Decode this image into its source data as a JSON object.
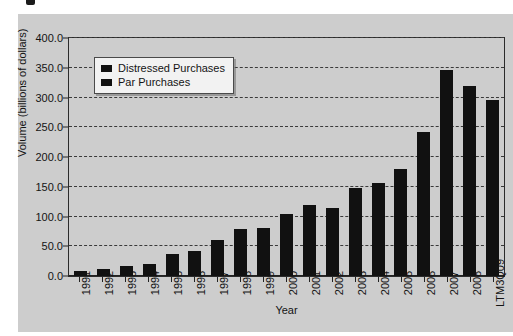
{
  "chart_data": {
    "type": "bar",
    "title": "",
    "xlabel": "Year",
    "ylabel": "Volume (billions of dollars)",
    "ylim": [
      0,
      400
    ],
    "ytick_step": 50,
    "grid": true,
    "legend_position": "top-left",
    "categories": [
      "1991",
      "1992",
      "1993",
      "1994",
      "1995",
      "1996",
      "1997",
      "1998",
      "1999",
      "2000",
      "2001",
      "2002",
      "2003",
      "2004",
      "2005",
      "2006",
      "2007",
      "2008",
      "LTM3Q09"
    ],
    "ytick_labels": [
      "400.0",
      "350.0",
      "300.0",
      "250.0",
      "200.0",
      "150.0",
      "100.0",
      "50.0",
      "0.0"
    ],
    "ytick_values": [
      400,
      350,
      300,
      250,
      200,
      150,
      100,
      50,
      0
    ],
    "series": [
      {
        "name": "Par Purchases",
        "color": "#111111",
        "values": [
          8,
          11,
          16,
          21,
          37,
          42,
          60,
          79,
          81,
          104,
          120,
          114,
          148,
          157,
          180,
          242,
          347,
          320,
          295
        ]
      }
    ],
    "legend": [
      {
        "label": "Distressed Purchases",
        "color": "#111111"
      },
      {
        "label": "Par Purchases",
        "color": "#111111"
      }
    ]
  },
  "figure": {
    "background": "#cdcdcd",
    "page_background": "#ffffff",
    "axis_color": "#222222",
    "gridline_color": "#3a3a3a"
  }
}
